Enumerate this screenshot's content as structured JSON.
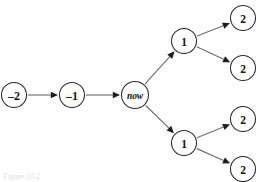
{
  "figure": {
    "kind": "event-tree-diagram",
    "caption_fragment": "Figure 10.2",
    "background_color": "#ffffff",
    "node_stroke_color": "#2b2b2b",
    "edge_color": "#6f6f6f",
    "arrow_color": "#1d1d1d",
    "label_color": "#141414"
  },
  "nodes": [
    {
      "id": "t-minus-2",
      "label": "–2",
      "cx": 14,
      "cy": 95,
      "r": 12.5,
      "style": "past"
    },
    {
      "id": "t-minus-1",
      "label": "–1",
      "cx": 72,
      "cy": 95,
      "r": 12.5,
      "style": "past"
    },
    {
      "id": "t-now",
      "label": "now",
      "cx": 135,
      "cy": 95,
      "r": 13.5,
      "style": "now"
    },
    {
      "id": "t-plus-1-upper",
      "label": "1",
      "cx": 184,
      "cy": 41,
      "r": 12.5,
      "style": "future"
    },
    {
      "id": "t-plus-1-lower",
      "label": "1",
      "cx": 184,
      "cy": 143,
      "r": 12.5,
      "style": "future"
    },
    {
      "id": "t-plus-2-a",
      "label": "2",
      "cx": 243,
      "cy": 18,
      "r": 12.5,
      "style": "future"
    },
    {
      "id": "t-plus-2-b",
      "label": "2",
      "cx": 243,
      "cy": 68,
      "r": 12.5,
      "style": "future"
    },
    {
      "id": "t-plus-2-c",
      "label": "2",
      "cx": 243,
      "cy": 119,
      "r": 12.5,
      "style": "future"
    },
    {
      "id": "t-plus-2-d",
      "label": "2",
      "cx": 243,
      "cy": 169,
      "r": 12.5,
      "style": "future"
    }
  ],
  "edges": [
    {
      "id": "edge-m2-m1",
      "from": "t-minus-2",
      "to": "t-minus-1"
    },
    {
      "id": "edge-m1-now",
      "from": "t-minus-1",
      "to": "t-now"
    },
    {
      "id": "edge-now-up1",
      "from": "t-now",
      "to": "t-plus-1-upper"
    },
    {
      "id": "edge-now-low1",
      "from": "t-now",
      "to": "t-plus-1-lower"
    },
    {
      "id": "edge-up1-2a",
      "from": "t-plus-1-upper",
      "to": "t-plus-2-a"
    },
    {
      "id": "edge-up1-2b",
      "from": "t-plus-1-upper",
      "to": "t-plus-2-b"
    },
    {
      "id": "edge-low1-2c",
      "from": "t-plus-1-lower",
      "to": "t-plus-2-c"
    },
    {
      "id": "edge-low1-2d",
      "from": "t-plus-1-lower",
      "to": "t-plus-2-d"
    }
  ]
}
